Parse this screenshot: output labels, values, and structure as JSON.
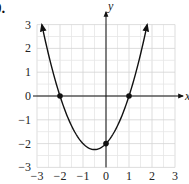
{
  "problem": {
    "label": "0."
  },
  "chart_data": {
    "type": "line",
    "title": "",
    "function": "y = x^2 + x - 2",
    "xlabel": "x",
    "ylabel": "y",
    "xlim": [
      -3,
      3
    ],
    "ylim": [
      -3,
      3
    ],
    "grid": true,
    "minor_grid_step": 0.5,
    "x_ticks": [
      "-3",
      "-2",
      "-1",
      "0",
      "1",
      "2",
      "3"
    ],
    "y_ticks": [
      "3",
      "2",
      "1",
      "0",
      "-1",
      "-2",
      "-3"
    ],
    "series": [
      {
        "name": "parabola",
        "x": [
          -2.79,
          -2.5,
          -2,
          -1.5,
          -1,
          -0.5,
          0,
          0.5,
          1,
          1.5,
          1.79
        ],
        "y": [
          3.0,
          1.75,
          0,
          -1.25,
          -2,
          -2.25,
          -2,
          -1.25,
          0,
          1.75,
          3.0
        ],
        "arrows_at_ends": true
      }
    ],
    "points": [
      {
        "x": -2,
        "y": 0,
        "label": "x-intercept"
      },
      {
        "x": 1,
        "y": 0,
        "label": "x-intercept"
      },
      {
        "x": 0,
        "y": -2,
        "label": "y-intercept"
      }
    ],
    "vertex": {
      "x": -0.5,
      "y": -2.25
    }
  }
}
